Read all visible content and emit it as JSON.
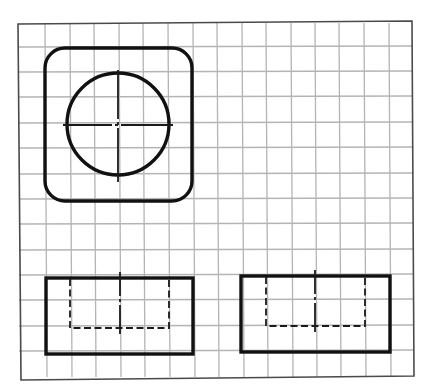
{
  "drawing": {
    "type": "orthographic-projection-on-grid",
    "colors": {
      "background": "#ffffff",
      "grid": "#b4b4b4",
      "frame": "#4a4a4a",
      "visible_line": "#111111"
    },
    "grid": {
      "columns": 16,
      "rows": 14,
      "cell_size_px": 24.7
    },
    "views": [
      {
        "name": "top-view",
        "shapes": [
          "rounded-square",
          "circle",
          "center-mark"
        ]
      },
      {
        "name": "front-view",
        "shapes": [
          "rectangle",
          "hidden-rectangle",
          "center-line"
        ]
      },
      {
        "name": "side-view",
        "shapes": [
          "rectangle",
          "hidden-rectangle",
          "center-line"
        ]
      }
    ]
  }
}
